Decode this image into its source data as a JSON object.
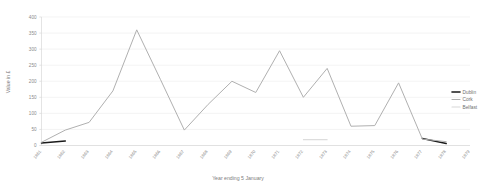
{
  "chart_data": {
    "type": "line",
    "title": "",
    "xlabel": "Year ending 5 January",
    "ylabel": "Value in £",
    "ylim": [
      0,
      400
    ],
    "yticks": [
      0,
      50,
      100,
      150,
      200,
      250,
      300,
      350,
      400
    ],
    "grid": true,
    "legend_position": "right",
    "categories": [
      "1861",
      "1862",
      "1863",
      "1864",
      "1865",
      "1866",
      "1867",
      "1868",
      "1869",
      "1870",
      "1871",
      "1872",
      "1873",
      "1874",
      "1875",
      "1876",
      "1877",
      "1878",
      "1879"
    ],
    "series": [
      {
        "name": "Dublin",
        "color": "#1a1a1a",
        "values": [
          8,
          14,
          null,
          null,
          null,
          null,
          null,
          null,
          null,
          null,
          null,
          null,
          null,
          null,
          null,
          null,
          22,
          6,
          null
        ]
      },
      {
        "name": "Cork",
        "color": "#b0b0b0",
        "values": [
          10,
          48,
          72,
          170,
          360,
          205,
          48,
          128,
          200,
          165,
          295,
          150,
          240,
          60,
          62,
          195,
          20,
          12,
          null
        ]
      },
      {
        "name": "Belfast",
        "color": "#d4d4d4",
        "values": [
          null,
          null,
          null,
          null,
          null,
          null,
          null,
          null,
          null,
          null,
          null,
          18,
          18,
          null,
          null,
          null,
          null,
          null,
          null
        ]
      }
    ]
  },
  "legend": {
    "items": [
      {
        "label": "Dublin",
        "color": "#1a1a1a"
      },
      {
        "label": "Cork",
        "color": "#b0b0b0"
      },
      {
        "label": "Belfast",
        "color": "#d8d8d8"
      }
    ]
  },
  "axes": {
    "y_title": "Value in £",
    "x_title": "Year ending 5 January"
  }
}
